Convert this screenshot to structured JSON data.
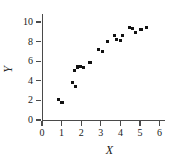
{
  "figure": {
    "background_color": "#ffffff",
    "marker_color": "#111111",
    "axis_color": "#4a4a4a"
  },
  "axes": {
    "x_title": "X",
    "y_title": "Y",
    "x_ticks": [
      "0",
      "1",
      "2",
      "3",
      "4",
      "5",
      "6"
    ],
    "y_ticks": [
      "0",
      "2",
      "4",
      "6",
      "8",
      "10"
    ]
  },
  "chart_data": {
    "type": "scatter",
    "title": "",
    "xlabel": "X",
    "ylabel": "Y",
    "xlim": [
      0,
      6.3
    ],
    "ylim": [
      0,
      10.9
    ],
    "xticks": [
      0,
      1,
      2,
      3,
      4,
      5,
      6
    ],
    "yticks": [
      0,
      2,
      4,
      6,
      8,
      10
    ],
    "grid": false,
    "legend": false,
    "marker": "square",
    "marker_color": "#111111",
    "series": [
      {
        "name": "observations",
        "points": [
          [
            0.85,
            2.1
          ],
          [
            1.02,
            1.8
          ],
          [
            1.55,
            3.8
          ],
          [
            1.72,
            3.45
          ],
          [
            1.65,
            5.05
          ],
          [
            1.82,
            5.4
          ],
          [
            1.95,
            5.45
          ],
          [
            2.12,
            5.35
          ],
          [
            2.45,
            5.9
          ],
          [
            2.88,
            7.2
          ],
          [
            3.08,
            6.95
          ],
          [
            3.35,
            8.0
          ],
          [
            3.68,
            8.6
          ],
          [
            3.8,
            8.2
          ],
          [
            4.0,
            8.1
          ],
          [
            4.1,
            8.6
          ],
          [
            4.45,
            9.4
          ],
          [
            4.62,
            9.35
          ],
          [
            4.78,
            8.95
          ],
          [
            5.05,
            9.2
          ],
          [
            5.35,
            9.45
          ]
        ]
      }
    ]
  }
}
